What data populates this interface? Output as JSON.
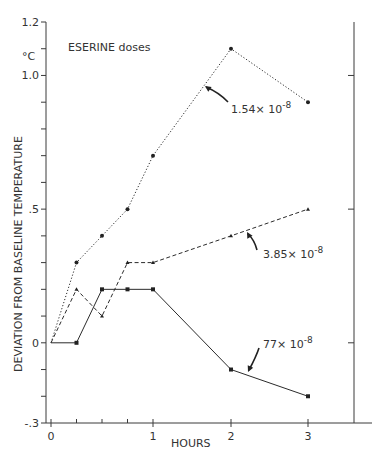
{
  "chart_data": {
    "type": "line",
    "title": "",
    "annotation_title": "ESERINE doses",
    "xlabel": "HOURS",
    "ylabel": "DEVIATION FROM BASELINE TEMPERATURE",
    "yunit": "°C",
    "xlim": [
      0,
      3
    ],
    "ylim": [
      -0.3,
      1.2
    ],
    "x_ticks_labeled": [
      {
        "value": 0,
        "label": "0"
      },
      {
        "value": 1,
        "label": "1"
      },
      {
        "value": 2,
        "label": "2"
      },
      {
        "value": 3,
        "label": "3"
      }
    ],
    "x_ticks_minor": [
      0.25,
      0.5,
      0.75
    ],
    "y_ticks_labeled": [
      {
        "value": 1.2,
        "label": "1.2"
      },
      {
        "value": 1.0,
        "label": "1.0"
      },
      {
        "value": 0.5,
        "label": ".5"
      },
      {
        "value": 0,
        "label": "0"
      },
      {
        "value": -0.3,
        "label": "-.3"
      }
    ],
    "y_ticks_minor": [
      1.1,
      0.9,
      0.8,
      0.7,
      0.6,
      0.4,
      0.3,
      0.2,
      0.1,
      -0.1,
      -0.2
    ],
    "right_axis_ticks": [
      1.0,
      0.5,
      0
    ],
    "grid": false,
    "x": [
      0,
      0.25,
      0.5,
      0.75,
      1,
      2,
      3
    ],
    "series": [
      {
        "name": "1.54×10-8",
        "label_main": "1.54× 10",
        "label_exp": "-8",
        "style": "dotted",
        "marker": "circle",
        "values": [
          0,
          0.3,
          0.4,
          0.5,
          0.7,
          1.1,
          0.9
        ]
      },
      {
        "name": "3.85×10-8",
        "label_main": "3.85× 10",
        "label_exp": "-8",
        "style": "dashed",
        "marker": "triangle",
        "values": [
          0,
          0.2,
          0.1,
          0.3,
          0.3,
          0.4,
          0.5
        ]
      },
      {
        "name": "77×10-8",
        "label_main": "77× 10",
        "label_exp": "-8",
        "style": "solid",
        "marker": "square",
        "values": [
          0,
          0,
          0.2,
          0.2,
          0.2,
          -0.1,
          -0.2
        ]
      }
    ]
  }
}
